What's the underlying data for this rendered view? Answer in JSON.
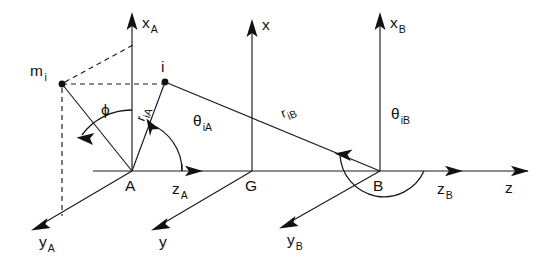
{
  "figure": {
    "background_color": "#ffffff",
    "line_color": "#1a1a1a"
  },
  "points": [
    {
      "id": "A",
      "label": "A",
      "x": 132,
      "y": 171,
      "kind": "origin-frame-A"
    },
    {
      "id": "G",
      "label": "G",
      "x": 252,
      "y": 171,
      "kind": "origin-frame-G"
    },
    {
      "id": "B",
      "label": "B",
      "x": 380,
      "y": 171,
      "kind": "origin-frame-B"
    },
    {
      "id": "i",
      "label": "i",
      "x": 165,
      "y": 82,
      "kind": "mass-point"
    },
    {
      "id": "mi",
      "label": "m",
      "sub": "i",
      "x": 62,
      "y": 84,
      "kind": "mass-point-mi"
    }
  ],
  "axes": [
    {
      "id": "xA",
      "label": "x",
      "sub": "A",
      "direction": "up",
      "from": [
        132,
        171
      ],
      "to": [
        132,
        15
      ]
    },
    {
      "id": "zA",
      "label": "z",
      "sub": "A",
      "direction": "right",
      "from": [
        132,
        171
      ],
      "to": [
        202,
        171
      ]
    },
    {
      "id": "yA",
      "label": "y",
      "sub": "A",
      "direction": "down-left",
      "from": [
        132,
        171
      ],
      "to": [
        32,
        230
      ]
    },
    {
      "id": "x",
      "label": "x",
      "sub": "",
      "direction": "up",
      "from": [
        252,
        171
      ],
      "to": [
        252,
        22
      ]
    },
    {
      "id": "y",
      "label": "y",
      "sub": "",
      "direction": "down-left",
      "from": [
        252,
        171
      ],
      "to": [
        152,
        230
      ]
    },
    {
      "id": "xB",
      "label": "x",
      "sub": "B",
      "direction": "up",
      "from": [
        380,
        171
      ],
      "to": [
        380,
        15
      ]
    },
    {
      "id": "zB",
      "label": "z",
      "sub": "B",
      "direction": "right",
      "from": [
        380,
        171
      ],
      "to": [
        462,
        171
      ]
    },
    {
      "id": "yB",
      "label": "y",
      "sub": "B",
      "direction": "down-left",
      "from": [
        380,
        171
      ],
      "to": [
        280,
        228
      ]
    },
    {
      "id": "z",
      "label": "z",
      "sub": "",
      "direction": "right",
      "from": [
        380,
        171
      ],
      "to": [
        528,
        171
      ]
    }
  ],
  "labels": {
    "x_A": {
      "text": "x",
      "sub": "A",
      "x": 142,
      "y": 28
    },
    "x_center": {
      "text": "x",
      "sub": "",
      "x": 262,
      "y": 30
    },
    "x_B": {
      "text": "x",
      "sub": "B",
      "x": 390,
      "y": 28
    },
    "y_A": {
      "text": "y",
      "sub": "A",
      "x": 39,
      "y": 247
    },
    "y_center": {
      "text": "y",
      "sub": "",
      "x": 159,
      "y": 247
    },
    "y_B": {
      "text": "y",
      "sub": "B",
      "x": 287,
      "y": 245
    },
    "z_A": {
      "text": "z",
      "sub": "A",
      "x": 172,
      "y": 194
    },
    "z_B": {
      "text": "z",
      "sub": "B",
      "x": 437,
      "y": 194
    },
    "z_global": {
      "text": "z",
      "sub": "",
      "x": 505,
      "y": 193
    },
    "A": {
      "text": "A",
      "sub": "",
      "x": 125,
      "y": 191
    },
    "G": {
      "text": "G",
      "sub": "",
      "x": 245,
      "y": 191
    },
    "B": {
      "text": "B",
      "sub": "",
      "x": 373,
      "y": 191
    },
    "i": {
      "text": "i",
      "sub": "",
      "x": 163,
      "y": 72
    },
    "m_i": {
      "text": "m",
      "sub": "i",
      "x": 30,
      "y": 76
    },
    "r_iA": {
      "text": "r",
      "sub": "iA",
      "x": 144,
      "y": 120,
      "rotation": -70
    },
    "r_iB": {
      "text": "r",
      "sub": "iB",
      "x": 285,
      "y": 116,
      "rotation": -22
    },
    "theta_iA": {
      "text": "θ",
      "sub": "iA",
      "x": 196,
      "y": 126
    },
    "theta_iB": {
      "text": "θ",
      "sub": "iB",
      "x": 393,
      "y": 119
    },
    "phi": {
      "text": "ϕ",
      "sub": "",
      "x": 104,
      "y": 113
    }
  },
  "vectors": [
    {
      "id": "r_iA",
      "label": "r",
      "sub": "iA",
      "from": [
        132,
        171
      ],
      "to": [
        165,
        82
      ],
      "style": "solid",
      "description": "position vector from A to point i"
    },
    {
      "id": "r_iB",
      "label": "r",
      "sub": "iB",
      "from": [
        165,
        82
      ],
      "to": [
        380,
        171
      ],
      "style": "solid",
      "description": "position vector from point i to B"
    },
    {
      "id": "A_mi",
      "label": "",
      "sub": "",
      "from": [
        132,
        171
      ],
      "to": [
        62,
        84
      ],
      "style": "solid",
      "description": "line from A to m_i"
    }
  ],
  "dashed_construction": [
    {
      "id": "mi-to-i-horizontal",
      "from": [
        62,
        84
      ],
      "to": [
        168,
        84
      ],
      "description": "horizontal dashed line from m_i through x_A axis to point i"
    },
    {
      "id": "mi-to-xA-diagonal",
      "from": [
        62,
        84
      ],
      "to": [
        133,
        45
      ],
      "description": "dashed line from m_i up to x_A axis"
    },
    {
      "id": "mi-vertical-drop",
      "from": [
        62,
        84
      ],
      "to": [
        62,
        216
      ],
      "description": "vertical dashed drop line below m_i"
    }
  ],
  "angles": [
    {
      "id": "phi",
      "symbol": "ϕ",
      "sub": "",
      "vertex": [
        132,
        171
      ],
      "from_axis": "x_A",
      "to_ray": "A-m_i",
      "arrow_at": "ray",
      "description": "angle phi between x_A axis and line A-m_i"
    },
    {
      "id": "theta_iA",
      "symbol": "θ",
      "sub": "iA",
      "vertex": [
        132,
        171
      ],
      "from_axis": "z_A",
      "to_ray": "r_iA",
      "arrow_at": "ray",
      "description": "angle theta_iA between z_A axis and r_iA"
    },
    {
      "id": "theta_iB",
      "symbol": "θ",
      "sub": "iB",
      "vertex": [
        380,
        171
      ],
      "from_axis": "z_B",
      "to_ray": "r_iB",
      "arrow_at": "ray",
      "description": "angle theta_iB between z_B axis and r_iB, measured counterclockwise"
    }
  ],
  "baseline": {
    "from": [
      93,
      171
    ],
    "to": [
      528,
      171
    ],
    "description": "common horizontal z axis through A, G and B"
  }
}
